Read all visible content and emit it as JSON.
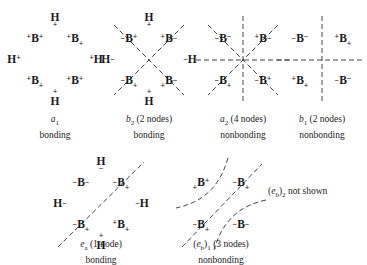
{
  "figure": {
    "note_text": "not shown",
    "note_symbol_open": "(",
    "note_symbol_e": "e",
    "note_symbol_sub_b": "b",
    "note_symbol_close": ")",
    "note_symbol_sub2": "2"
  },
  "orbitals": [
    {
      "id": "a1",
      "label_symbol": "a",
      "label_sub": "1",
      "label_nodes": "",
      "caption_line2": "bonding",
      "nodes_count": 0,
      "node_style": "none",
      "atoms": [
        {
          "element": "H",
          "pre": "",
          "post": "",
          "below": "+",
          "above": "",
          "x": 53,
          "y": 10
        },
        {
          "element": "B",
          "pre": "+",
          "post": "+",
          "below": "",
          "above": "",
          "x": 33,
          "y": 31
        },
        {
          "element": "B",
          "pre": "+",
          "post": "",
          "below": "+",
          "above": "",
          "x": 73,
          "y": 31
        },
        {
          "element": "H",
          "pre": "",
          "post": "+",
          "below": "",
          "above": "",
          "x": 12,
          "y": 52
        },
        {
          "element": "H",
          "pre": "+",
          "post": "",
          "below": "",
          "above": "",
          "x": 94,
          "y": 52
        },
        {
          "element": "B",
          "pre": "+",
          "post": "",
          "below": "+",
          "above": "",
          "x": 33,
          "y": 73
        },
        {
          "element": "B",
          "pre": "+",
          "post": "+",
          "below": "",
          "above": "",
          "x": 73,
          "y": 73
        },
        {
          "element": "H",
          "pre": "",
          "post": "",
          "below": "",
          "above": "+",
          "x": 53,
          "y": 94
        }
      ]
    },
    {
      "id": "b2",
      "label_symbol": "b",
      "label_sub": "2",
      "label_nodes": "(2 nodes)",
      "caption_line2": "bonding",
      "nodes_count": 2,
      "node_style": "diagonal-x",
      "atoms": [
        {
          "element": "H",
          "pre": "",
          "post": "",
          "below": "+",
          "above": "",
          "x": 53,
          "y": 10
        },
        {
          "element": "B",
          "pre": "-",
          "post": "+",
          "below": "",
          "above": "",
          "x": 33,
          "y": 31
        },
        {
          "element": "B",
          "pre": "+",
          "post": "-",
          "below": "",
          "above": "",
          "x": 73,
          "y": 31
        },
        {
          "element": "H",
          "pre": "",
          "post": "-",
          "below": "",
          "above": "",
          "x": 12,
          "y": 52
        },
        {
          "element": "H",
          "pre": "-",
          "post": "",
          "below": "",
          "above": "",
          "x": 94,
          "y": 52
        },
        {
          "element": "B",
          "pre": "-",
          "post": "",
          "below": "+",
          "above": "",
          "x": 33,
          "y": 73
        },
        {
          "element": "B",
          "pre": "+",
          "post": "-",
          "below": "",
          "above": "",
          "x": 73,
          "y": 73
        },
        {
          "element": "H",
          "pre": "",
          "post": "",
          "below": "",
          "above": "+",
          "x": 53,
          "y": 94
        }
      ]
    },
    {
      "id": "a2",
      "label_symbol": "a",
      "label_sub": "2",
      "label_nodes": "(4 nodes)",
      "caption_line2": "nonbonding",
      "nodes_count": 4,
      "node_style": "star-eight",
      "atoms": [
        {
          "element": "B",
          "pre": "-",
          "post": "-",
          "below": "",
          "above": "",
          "x": 33,
          "y": 31
        },
        {
          "element": "B",
          "pre": "+",
          "post": "-",
          "below": "",
          "above": "",
          "x": 73,
          "y": 31
        },
        {
          "element": "B",
          "pre": "-",
          "post": "",
          "below": "+",
          "above": "",
          "x": 33,
          "y": 73
        },
        {
          "element": "B",
          "pre": "-",
          "post": "+",
          "below": "",
          "above": "",
          "x": 73,
          "y": 73
        }
      ]
    },
    {
      "id": "b1",
      "label_symbol": "b",
      "label_sub": "1",
      "label_nodes": "(2 nodes)",
      "caption_line2": "nonbonding",
      "nodes_count": 2,
      "node_style": "cross-plus",
      "atoms": [
        {
          "element": "B",
          "pre": "-",
          "post": "-",
          "below": "",
          "above": "",
          "x": 33,
          "y": 31
        },
        {
          "element": "B",
          "pre": "+",
          "post": "",
          "below": "+",
          "above": "",
          "x": 73,
          "y": 31
        },
        {
          "element": "B",
          "pre": "+",
          "post": "",
          "below": "+",
          "above": "",
          "x": 33,
          "y": 73
        },
        {
          "element": "B",
          "pre": "-",
          "post": "-",
          "below": "",
          "above": "",
          "x": 73,
          "y": 73
        }
      ]
    },
    {
      "id": "ea",
      "label_symbol": "e",
      "label_sub": "a",
      "label_nodes": "(1 node)",
      "caption_line2": "bonding",
      "nodes_count": 1,
      "node_style": "diagonal-one",
      "atoms": [
        {
          "element": "H",
          "pre": "",
          "post": "",
          "below": "-",
          "above": "",
          "x": 53,
          "y": 10
        },
        {
          "element": "B",
          "pre": "-",
          "post": "-",
          "below": "",
          "above": "",
          "x": 33,
          "y": 31
        },
        {
          "element": "B",
          "pre": "-",
          "post": "",
          "below": "+",
          "above": "",
          "x": 73,
          "y": 31
        },
        {
          "element": "H",
          "pre": "",
          "post": "-",
          "below": "",
          "above": "",
          "x": 12,
          "y": 52
        },
        {
          "element": "H",
          "pre": "-",
          "post": "",
          "below": "",
          "above": "",
          "x": 94,
          "y": 52
        },
        {
          "element": "B",
          "pre": "-",
          "post": "",
          "below": "+",
          "above": "",
          "x": 33,
          "y": 73
        },
        {
          "element": "B",
          "pre": "+",
          "post": "+",
          "below": "",
          "above": "",
          "x": 73,
          "y": 73
        },
        {
          "element": "H",
          "pre": "",
          "post": "",
          "below": "",
          "above": "+",
          "x": 53,
          "y": 94
        }
      ]
    },
    {
      "id": "eb1",
      "label_symbol": "e",
      "label_sub": "b",
      "label_sub_outer": "1",
      "label_nodes": "(3 nodes)",
      "caption_line2": "nonbonding",
      "nodes_count": 3,
      "node_style": "curved-three",
      "atoms": [
        {
          "element": "B",
          "pre": "+",
          "post": "+",
          "below": "",
          "above": "",
          "x": 33,
          "y": 31
        },
        {
          "element": "B",
          "pre": "-",
          "post": "",
          "below": "+",
          "above": "",
          "x": 73,
          "y": 31
        },
        {
          "element": "B",
          "pre": "-",
          "post": "",
          "below": "+",
          "above": "",
          "x": 33,
          "y": 73
        },
        {
          "element": "B",
          "pre": "-",
          "post": "-",
          "below": "",
          "above": "",
          "x": 73,
          "y": 73
        }
      ]
    }
  ]
}
